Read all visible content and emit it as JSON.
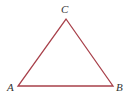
{
  "diagram": {
    "type": "triangle",
    "stroke_color": "#a8404a",
    "vertices": [
      {
        "label": "A",
        "x": 18,
        "y": 86
      },
      {
        "label": "B",
        "x": 113,
        "y": 86
      },
      {
        "label": "C",
        "x": 66,
        "y": 19
      }
    ]
  }
}
